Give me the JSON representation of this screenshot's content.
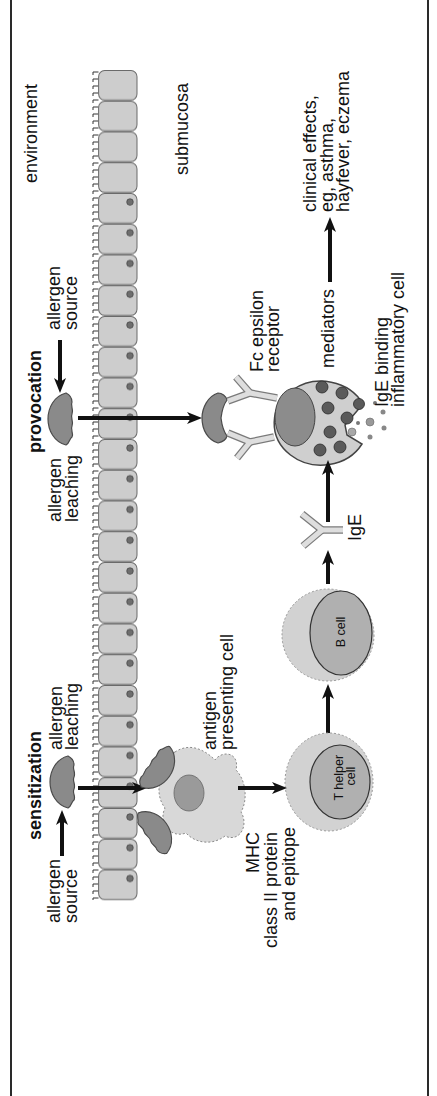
{
  "compartments": {
    "environment": "environment",
    "submucosa": "submucosa"
  },
  "provocation": {
    "heading": "provocation",
    "allergen_source": [
      "allergen",
      "source"
    ],
    "allergen_leaching": [
      "allergen",
      "leaching"
    ],
    "fc_epsilon_receptor": [
      "Fc epsilon",
      "receptor"
    ],
    "ige_binding_cell": [
      "IgE binding",
      "inflammatory cell"
    ],
    "mediators": "mediators",
    "clinical_effects": [
      "clinical effects,",
      "eg, asthma,",
      "hayfever, eczema"
    ]
  },
  "sensitization": {
    "heading": "sensitization",
    "allergen_source": [
      "allergen",
      "source"
    ],
    "allergen_leaching": [
      "allergen",
      "leaching"
    ],
    "antigen_presenting_cell": [
      "antigen",
      "presenting cell"
    ],
    "mhc": [
      "MHC",
      "class II protein",
      "and epitope"
    ],
    "t_helper_cell": [
      "T helper",
      "cell"
    ],
    "b_cell": "B cell",
    "ige": "IgE"
  },
  "palette": {
    "ink": "#111111",
    "epithelium": "#cdcdcd",
    "allergen": "#8a8a8a",
    "cell_body": "#d0d0d0",
    "nucleus": "#8c8c8c"
  }
}
